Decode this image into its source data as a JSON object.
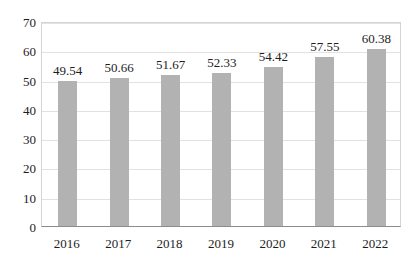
{
  "chart_data": {
    "type": "bar",
    "title": "",
    "subtitle": "",
    "xlabel": "",
    "ylabel": "",
    "categories": [
      "2016",
      "2017",
      "2018",
      "2019",
      "2020",
      "2021",
      "2022"
    ],
    "values": [
      49.54,
      50.66,
      51.67,
      52.33,
      54.42,
      57.55,
      60.38
    ],
    "value_labels": [
      "49.54",
      "50.66",
      "51.67",
      "52.33",
      "54.42",
      "57.55",
      "60.38"
    ],
    "ylim": [
      0,
      70
    ],
    "ytick_values": [
      0,
      10,
      20,
      30,
      40,
      50,
      60,
      70
    ],
    "ytick_labels": [
      "0",
      "10",
      "20",
      "30",
      "40",
      "50",
      "60",
      "70"
    ],
    "grid": true,
    "grid_axis": "y",
    "legend": false,
    "legend_position": "none",
    "series": [
      {
        "name": "",
        "values": [
          49.54,
          50.66,
          51.67,
          52.33,
          54.42,
          57.55,
          60.38
        ]
      }
    ],
    "colors": {
      "bar": "#b2b2b2",
      "gridline": "#e2e2e2",
      "axis": "#8c8c8c",
      "plot_border": "#d4d4d4",
      "text": "#1d1d1d",
      "background": "#ffffff"
    }
  }
}
